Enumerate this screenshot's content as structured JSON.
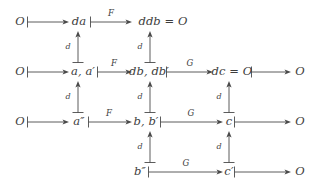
{
  "figure": {
    "kind": "commutative-diagram",
    "background_color": "#ffffff",
    "ink_color": "#3d3d3d",
    "width": 317,
    "height": 191
  },
  "nodes": {
    "r1c1": "O",
    "r1c2": "da",
    "r1c3": "ddb = O",
    "r2c1": "O",
    "r2c2": "a, a′",
    "r2c3": "db, db′",
    "r2c4": "dc = O",
    "r2c5": "O",
    "r3c1": "O",
    "r3c2": "a″",
    "r3c3": "b, b′",
    "r3c4": "c",
    "r3c5": "O",
    "r4c3": "b″",
    "r4c4": "c′",
    "r4c5": "O"
  },
  "edge_labels": {
    "row1_F": "F",
    "row2_F": "F",
    "row2_G": "G",
    "row3_F": "F",
    "row3_G": "G",
    "row4_G": "G",
    "d_col2_r1r2": "d",
    "d_col3_r1r2": "d",
    "d_col2_r2r3": "d",
    "d_col3_r2r3": "d",
    "d_col4_r2r3": "d",
    "d_col3_r3r4": "d",
    "d_col4_r3r4": "d"
  },
  "rows": [
    {
      "id": "row-1",
      "cells": [
        "O",
        "da",
        "ddb = O"
      ],
      "arrow_labels": [
        "",
        "F"
      ]
    },
    {
      "id": "row-2",
      "cells": [
        "O",
        "a, a′",
        "db, db′",
        "dc = O",
        "O"
      ],
      "arrow_labels": [
        "",
        "F",
        "G",
        ""
      ]
    },
    {
      "id": "row-3",
      "cells": [
        "O",
        "a″",
        "b, b′",
        "c",
        "O"
      ],
      "arrow_labels": [
        "",
        "F",
        "G",
        ""
      ]
    },
    {
      "id": "row-4",
      "cells": [
        "b″",
        "c′",
        "O"
      ],
      "arrow_labels": [
        "G",
        ""
      ]
    }
  ],
  "vertical_arrows": {
    "label": "d",
    "direction": "up",
    "style": "maps-to",
    "count": 7
  },
  "horizontal_arrows": {
    "style": "maps-to",
    "direction": "right",
    "count": 13
  }
}
